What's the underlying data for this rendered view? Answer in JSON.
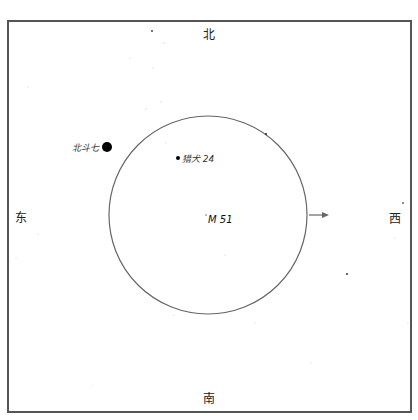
{
  "chart": {
    "type": "finder-chart",
    "directions": {
      "north": "北",
      "south": "南",
      "east": "东",
      "west": "西"
    },
    "field_circle": {
      "cx": 208,
      "cy": 215,
      "r": 99,
      "stroke": "#666666"
    },
    "arrow": {
      "x1": 309,
      "y1": 215,
      "x2": 329,
      "y2": 215,
      "color": "#666666"
    },
    "target": {
      "label": "M 51",
      "x": 206,
      "y": 215
    },
    "labeled_stars": [
      {
        "label": "北斗七",
        "x": 107,
        "y": 147,
        "r": 5
      },
      {
        "label": "猎犬 24",
        "x": 178,
        "y": 158,
        "r": 2
      }
    ],
    "faint_stars": [
      {
        "x": 152,
        "y": 31,
        "r": 0.9,
        "c": "#333"
      },
      {
        "x": 164,
        "y": 43,
        "r": 0.6,
        "c": "#bbb"
      },
      {
        "x": 130,
        "y": 58,
        "r": 0.6,
        "c": "#ccc"
      },
      {
        "x": 153,
        "y": 68,
        "r": 0.6,
        "c": "#bbb"
      },
      {
        "x": 28,
        "y": 87,
        "r": 0.6,
        "c": "#ccc"
      },
      {
        "x": 161,
        "y": 102,
        "r": 0.6,
        "c": "#bbb"
      },
      {
        "x": 146,
        "y": 109,
        "r": 0.6,
        "c": "#bbb"
      },
      {
        "x": 166,
        "y": 143,
        "r": 0.6,
        "c": "#ccc"
      },
      {
        "x": 266,
        "y": 134,
        "r": 1.1,
        "c": "#333"
      },
      {
        "x": 403,
        "y": 203,
        "r": 0.9,
        "c": "#555"
      },
      {
        "x": 38,
        "y": 234,
        "r": 0.6,
        "c": "#ccc"
      },
      {
        "x": 16,
        "y": 258,
        "r": 0.6,
        "c": "#ccc"
      },
      {
        "x": 174,
        "y": 315,
        "r": 0.6,
        "c": "#ccc"
      },
      {
        "x": 93,
        "y": 384,
        "r": 0.6,
        "c": "#ddd"
      },
      {
        "x": 347,
        "y": 274,
        "r": 1.0,
        "c": "#333"
      },
      {
        "x": 225,
        "y": 255,
        "r": 0.6,
        "c": "#ccc"
      },
      {
        "x": 255,
        "y": 323,
        "r": 0.6,
        "c": "#ccc"
      },
      {
        "x": 311,
        "y": 363,
        "r": 0.6,
        "c": "#ccc"
      },
      {
        "x": 395,
        "y": 238,
        "r": 0.6,
        "c": "#ccc"
      },
      {
        "x": 408,
        "y": 323,
        "r": 0.6,
        "c": "#ccc"
      }
    ]
  }
}
